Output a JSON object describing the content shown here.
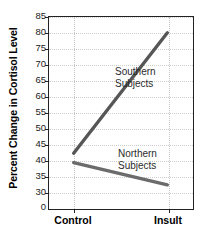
{
  "chart_data": {
    "type": "line",
    "title": "",
    "xlabel": "",
    "ylabel": "Percent Change in Cortisol Level",
    "categories": [
      "Control",
      "Insult"
    ],
    "x": [
      0,
      1
    ],
    "xlim": [
      -0.28,
      1.28
    ],
    "ylim": [
      30,
      85
    ],
    "yticks": [
      0,
      30,
      35,
      40,
      45,
      50,
      55,
      60,
      65,
      70,
      75,
      80,
      85
    ],
    "ytick_labels": [
      "0",
      "30",
      "35",
      "40",
      "45",
      "50",
      "55",
      "60",
      "65",
      "70",
      "75",
      "80",
      "85"
    ],
    "y_axis_broken": true,
    "y_axis_break_between": [
      0,
      30
    ],
    "grid": "both-dotted",
    "legend_position": "inline-annotation",
    "series": [
      {
        "name": "Southern Subjects",
        "values": [
          42,
          80
        ],
        "color": "#565656",
        "label_line1": "Southern",
        "label_line2": "Subjects"
      },
      {
        "name": "Northern Subjects",
        "values": [
          39,
          32
        ],
        "color": "#6b6b6b",
        "label_line1": "Northern",
        "label_line2": "Subjects"
      }
    ]
  },
  "axes": {
    "y_title": "Percent Change in Cortisol Level",
    "tick_0": "0",
    "tick_30": "30",
    "tick_35": "35",
    "tick_40": "40",
    "tick_45": "45",
    "tick_50": "50",
    "tick_55": "55",
    "tick_60": "60",
    "tick_65": "65",
    "tick_70": "70",
    "tick_75": "75",
    "tick_80": "80",
    "tick_85": "85",
    "x_cat_0": "Control",
    "x_cat_1": "Insult"
  },
  "annotations": {
    "southern_line1": "Southern",
    "southern_line2": "Subjects",
    "northern_line1": "Northern",
    "northern_line2": "Subjects"
  },
  "colors": {
    "southern_line": "#565656",
    "northern_line": "#6b6b6b",
    "frame": "#222222",
    "grid": "#cfcfcf",
    "text": "#000000"
  }
}
